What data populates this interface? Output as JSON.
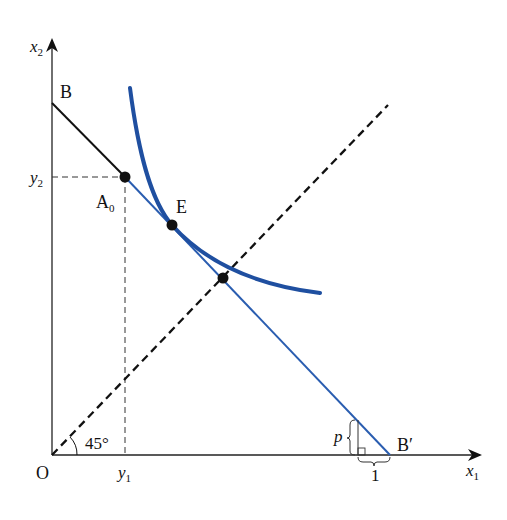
{
  "diagram": {
    "axes": {
      "x_label": "x",
      "x_sub": "1",
      "y_label": "x",
      "y_sub": "2",
      "origin": "O"
    },
    "points": {
      "B": "B",
      "A0": "A",
      "A0_sub": "0",
      "E": "E",
      "Bprime": "B′"
    },
    "ticks": {
      "y2": "y",
      "y2_sub": "2",
      "y1": "y",
      "y1_sub": "1"
    },
    "annotations": {
      "angle": "45°",
      "slope_rise": "p",
      "slope_run": "1"
    },
    "colors": {
      "curve": "#1f4fa0",
      "budget_line_blue": "#2a5db0",
      "budget_line_black": "#111111",
      "axes": "#222222"
    }
  }
}
